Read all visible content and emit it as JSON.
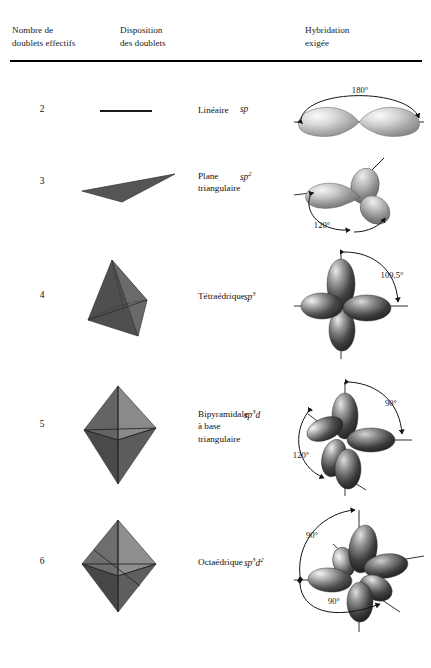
{
  "table": {
    "headers": [
      {
        "id": "header-count",
        "label": "Nombre de\ndoublets effectifs"
      },
      {
        "id": "header-arrangement",
        "label": "Disposition\ndes doublets"
      },
      {
        "id": "header-hybridization",
        "label": "Hybridation\nexigée"
      }
    ],
    "rows": [
      {
        "count": "2",
        "arrangement_name": "Linéaire",
        "hybridization_base": "sp",
        "hybridization_exponents": "",
        "shape_icon": "linear-segment-icon",
        "orbital_icon": "sp-orbital-lobes-icon",
        "angles": [
          "180°"
        ]
      },
      {
        "count": "3",
        "arrangement_name": "Plane\ntriangulaire",
        "hybridization_base": "sp",
        "hybridization_exponents": "2",
        "shape_icon": "triangle-plane-icon",
        "orbital_icon": "sp2-orbital-lobes-icon",
        "angles": [
          "120°"
        ]
      },
      {
        "count": "4",
        "arrangement_name": "Tétraédrique",
        "hybridization_base": "sp",
        "hybridization_exponents": "3",
        "shape_icon": "tetrahedron-icon",
        "orbital_icon": "sp3-orbital-lobes-icon",
        "angles": [
          "109,5°"
        ]
      },
      {
        "count": "5",
        "arrangement_name": "Bipyramidale\nà base\ntriangulaire",
        "hybridization_base": "sp",
        "hybridization_exponents": "3d",
        "shape_icon": "trigonal-bipyramid-icon",
        "orbital_icon": "sp3d-orbital-lobes-icon",
        "angles": [
          "90°",
          "120°"
        ]
      },
      {
        "count": "6",
        "arrangement_name": "Octaédrique",
        "hybridization_base": "sp",
        "hybridization_exponents": "3d2",
        "shape_icon": "octahedron-icon",
        "orbital_icon": "sp3d2-orbital-lobes-icon",
        "angles": [
          "90°",
          "90°"
        ]
      }
    ]
  },
  "angle_labels": {
    "r1_a1": "180°",
    "r2_a1": "120°",
    "r3_a1": "109,5°",
    "r4_a1": "90°",
    "r4_a2": "120°",
    "r5_a1": "90°",
    "r5_a2": "90°"
  },
  "hyb_display": {
    "r1": "sp",
    "r2": "sp",
    "r2_sup": "2",
    "r3": "sp",
    "r3_sup": "3",
    "r4": "sp",
    "r4_sup": "3",
    "r4_tail": "d",
    "r5": "sp",
    "r5_sup": "3",
    "r5_tail": "d",
    "r5_sup2": "2"
  },
  "colors": {
    "rule": "#000000",
    "text": "#111111",
    "shape_fill_dark": "#4a4a4a",
    "shape_fill_mid": "#6b6b6b",
    "shape_fill_light": "#8a8a8a",
    "lobe_light": "#f2f2f2",
    "lobe_dark": "#2e2e2e"
  }
}
